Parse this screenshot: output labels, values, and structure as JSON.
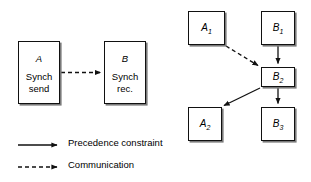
{
  "figure": {
    "background_color": "#ffffff",
    "line_color": "#111111",
    "shadow_color": "#7a7a7a"
  },
  "synch_pair": {
    "sender": {
      "title": "A",
      "body": "Synch\nsend"
    },
    "receiver": {
      "title": "B",
      "body": "Synch\nrec."
    },
    "connector": {
      "kind": "communication",
      "style": "dashed",
      "arrowhead": "filled-triangle"
    }
  },
  "task_graph": {
    "nodes": [
      {
        "id": "A1",
        "base": "A",
        "sub": "1"
      },
      {
        "id": "B1",
        "base": "B",
        "sub": "1"
      },
      {
        "id": "B2",
        "base": "B",
        "sub": "2"
      },
      {
        "id": "A2",
        "base": "A",
        "sub": "2"
      },
      {
        "id": "B3",
        "base": "B",
        "sub": "3"
      }
    ],
    "edges": [
      {
        "from": "A1",
        "to": "B2",
        "style": "dashed",
        "kind": "communication"
      },
      {
        "from": "B1",
        "to": "B2",
        "style": "solid",
        "kind": "precedence"
      },
      {
        "from": "B2",
        "to": "A2",
        "style": "solid",
        "kind": "precedence"
      },
      {
        "from": "B2",
        "to": "B3",
        "style": "solid",
        "kind": "precedence"
      }
    ]
  },
  "legend": {
    "items": [
      {
        "label": "Precedence constraint",
        "style": "solid"
      },
      {
        "label": "Communication",
        "style": "dashed"
      }
    ]
  }
}
